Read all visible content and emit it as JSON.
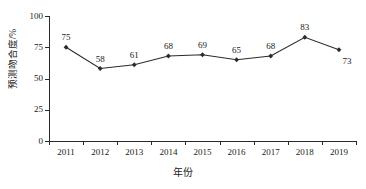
{
  "chart_data": {
    "type": "line",
    "title": "",
    "xlabel": "年份",
    "ylabel": "预测吻合度/%",
    "categories": [
      "2011",
      "2012",
      "2013",
      "2014",
      "2015",
      "2016",
      "2017",
      "2018",
      "2019"
    ],
    "values": [
      75,
      58,
      61,
      68,
      69,
      65,
      68,
      83,
      73
    ],
    "data_labels": [
      "75",
      "58",
      "61",
      "68",
      "69",
      "65",
      "68",
      "83",
      "73"
    ],
    "ylim": [
      0,
      100
    ],
    "ytick_labels": [
      "0",
      "25",
      "50",
      "75",
      "100"
    ],
    "ytick_values": [
      0,
      25,
      50,
      75,
      100
    ],
    "grid": false,
    "legend": "none",
    "marker": "diamond",
    "series_color": "#2b2b2b",
    "axis_color": "#2b2b2b",
    "background_color": "#ffffff",
    "label_positions": [
      "above",
      "above",
      "above",
      "above",
      "above",
      "above",
      "above",
      "above",
      "below-right"
    ]
  }
}
